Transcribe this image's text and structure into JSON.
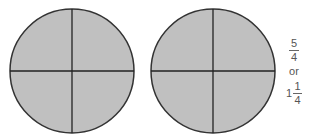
{
  "diagram": {
    "colors": {
      "fill": "#c0c0c0",
      "stroke": "#333333",
      "text": "#555555"
    },
    "circles": [
      {
        "id": "whole-1",
        "cx": 72,
        "cy": 71,
        "r": 62,
        "parts": 4,
        "shaded_parts": 4
      },
      {
        "id": "whole-2",
        "cx": 213,
        "cy": 71,
        "r": 62,
        "parts": 4,
        "shaded_parts": 4
      }
    ],
    "label": {
      "improper_numerator": "5",
      "improper_denominator": "4",
      "or_text": "or",
      "mixed_whole": "1",
      "mixed_numerator": "1",
      "mixed_denominator": "4"
    }
  }
}
